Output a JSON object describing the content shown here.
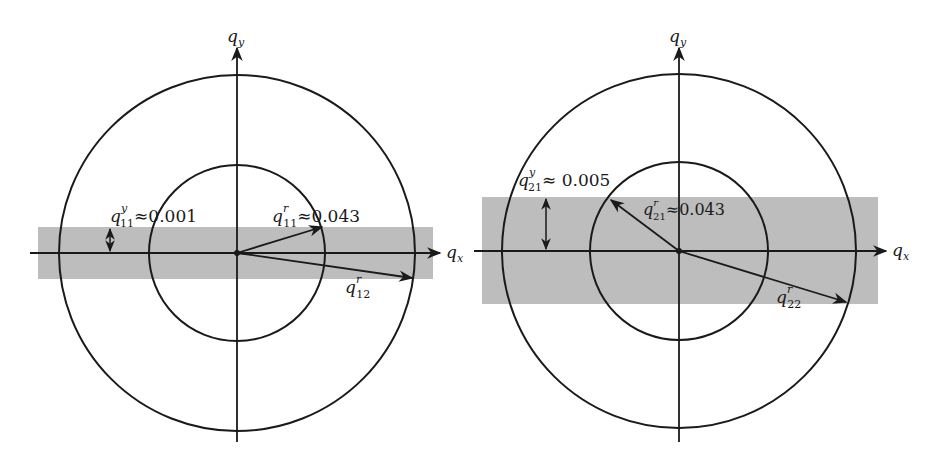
{
  "diagrams": [
    {
      "name": "left",
      "axis_x_label": "q",
      "axis_x_sub": "x",
      "axis_y_label": "q",
      "axis_y_sub": "y",
      "band_label_main": "q",
      "band_label_sup": "y",
      "band_label_sub": "11",
      "band_label_value": "≈0.001",
      "vec1_main": "q",
      "vec1_sup": "r",
      "vec1_sub": "11",
      "vec1_value": "≈0.043",
      "vec2_main": "q",
      "vec2_sup": "r",
      "vec2_sub": "12"
    },
    {
      "name": "right",
      "axis_x_label": "q",
      "axis_x_sub": "x",
      "axis_y_label": "q",
      "axis_y_sub": "y",
      "band_label_main": "q",
      "band_label_sup": "y",
      "band_label_sub": "21",
      "band_label_value": "≈ 0.005",
      "vec1_main": "q",
      "vec1_sup": "r",
      "vec1_sub": "21",
      "vec1_value": "≈0.043",
      "vec2_main": "q",
      "vec2_sup": "r",
      "vec2_sub": "22"
    }
  ],
  "colors": {
    "band": "#bdbdbd",
    "line": "#1a1a1a"
  }
}
